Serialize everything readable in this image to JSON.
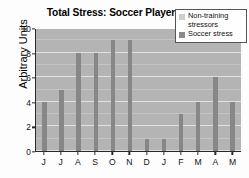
{
  "chart_data": {
    "type": "bar",
    "title": "Total Stress: Soccer Player",
    "xlabel": "",
    "ylabel": "Arbitrary Units",
    "categories": [
      "J",
      "J",
      "A",
      "S",
      "O",
      "N",
      "D",
      "J",
      "F",
      "M",
      "A",
      "M"
    ],
    "values": [
      4,
      5,
      8,
      8,
      9,
      9,
      1,
      1,
      3,
      4,
      6,
      4
    ],
    "series": [
      {
        "name": "Soccer stress",
        "values": [
          4,
          5,
          8,
          8,
          9,
          9,
          1,
          1,
          3,
          4,
          6,
          4
        ]
      }
    ],
    "ylim": [
      0,
      10
    ],
    "yticks": [
      0,
      2,
      4,
      6,
      8,
      10
    ],
    "ytick_labels": [
      "0",
      "2",
      "4",
      "6",
      "8",
      "10"
    ],
    "grid": true,
    "legend_position": "top-right"
  },
  "legend": {
    "entries": [
      {
        "label": "Non-training stressors",
        "color": "#cfcfcf"
      },
      {
        "label": "Soccer stress",
        "color": "#8a8a8a"
      }
    ]
  },
  "colors": {
    "plot_background": "#b4b4b4",
    "bar": "#878787",
    "gridline": "#e8e8e8",
    "axis": "#2a2a2a",
    "figure_background": "#fdfdfd"
  }
}
